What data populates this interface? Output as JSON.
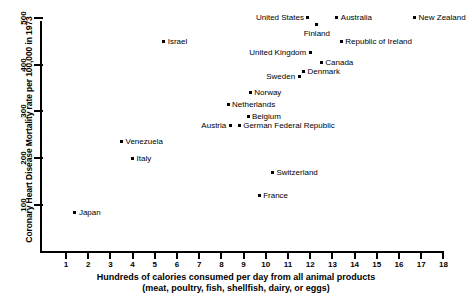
{
  "chart_data": {
    "type": "scatter",
    "title": "",
    "xlabel": "Hundreds of calories consumed per day from all animal products (meat, poultry, fish, shellfish, dairy, or eggs)",
    "xlabel_line1": "Hundreds of calories consumed per day from all animal products",
    "xlabel_line2": "(meat, poultry, fish, shellfish, dairy, or eggs)",
    "ylabel": "Coronary Heart Disease Mortality rate per 100,000 in 1973",
    "xlim": [
      0.0,
      18.6
    ],
    "ylim": [
      0,
      550
    ],
    "xticks": [
      1,
      2,
      3,
      4,
      5,
      6,
      7,
      8,
      9,
      10,
      11,
      12,
      13,
      14,
      15,
      16,
      17,
      18
    ],
    "yticks": [
      100,
      200,
      300,
      400,
      500
    ],
    "grid": false,
    "legend": "none",
    "marker_color": "#000000",
    "points": [
      {
        "label": "United States",
        "x": 11.9,
        "y": 500,
        "label_pos": "left"
      },
      {
        "label": "Finland",
        "x": 12.3,
        "y": 485,
        "label_pos": "below"
      },
      {
        "label": "Australia",
        "x": 13.2,
        "y": 500,
        "label_pos": "right"
      },
      {
        "label": "New Zealand",
        "x": 16.7,
        "y": 500,
        "label_pos": "right"
      },
      {
        "label": "Israel",
        "x": 5.4,
        "y": 450,
        "label_pos": "right"
      },
      {
        "label": "Republic of Ireland",
        "x": 13.4,
        "y": 450,
        "label_pos": "right"
      },
      {
        "label": "United Kingdom",
        "x": 12.0,
        "y": 425,
        "label_pos": "left"
      },
      {
        "label": "Canada",
        "x": 12.5,
        "y": 405,
        "label_pos": "right"
      },
      {
        "label": "Denmark",
        "x": 11.7,
        "y": 385,
        "label_pos": "right"
      },
      {
        "label": "Sweden",
        "x": 11.5,
        "y": 375,
        "label_pos": "left"
      },
      {
        "label": "Norway",
        "x": 9.3,
        "y": 340,
        "label_pos": "right"
      },
      {
        "label": "Netherlands",
        "x": 8.3,
        "y": 315,
        "label_pos": "right"
      },
      {
        "label": "Belgium",
        "x": 9.2,
        "y": 290,
        "label_pos": "right"
      },
      {
        "label": "Austria",
        "x": 8.4,
        "y": 270,
        "label_pos": "left"
      },
      {
        "label": "German Federal Republic",
        "x": 8.8,
        "y": 270,
        "label_pos": "right"
      },
      {
        "label": "Venezuela",
        "x": 3.5,
        "y": 235,
        "label_pos": "right"
      },
      {
        "label": "Italy",
        "x": 4.0,
        "y": 200,
        "label_pos": "right"
      },
      {
        "label": "Switzerland",
        "x": 10.3,
        "y": 170,
        "label_pos": "right"
      },
      {
        "label": "France",
        "x": 9.7,
        "y": 120,
        "label_pos": "right"
      },
      {
        "label": "Japan",
        "x": 1.4,
        "y": 85,
        "label_pos": "right"
      }
    ]
  }
}
